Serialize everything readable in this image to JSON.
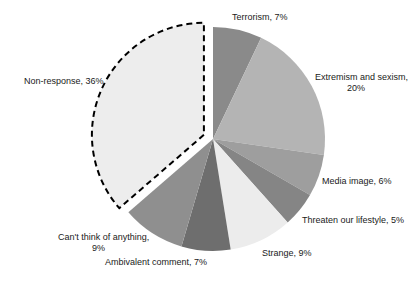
{
  "chart_data": {
    "type": "pie",
    "title": "",
    "start_angle_deg": 0,
    "direction": "clockwise",
    "slices": [
      {
        "label": "Terrorism",
        "value": 7,
        "display": "Terrorism, 7%",
        "color": "#8a8a8a",
        "exploded": false
      },
      {
        "label": "Extremism and sexism",
        "value": 20,
        "display_lines": [
          "Extremism and sexism,",
          "20%"
        ],
        "color": "#b4b4b4",
        "exploded": false
      },
      {
        "label": "Media image",
        "value": 6,
        "display": "Media image, 6%",
        "color": "#9e9e9e",
        "exploded": false
      },
      {
        "label": "Threaten our lifestyle",
        "value": 5,
        "display": "Threaten our lifestyle, 5%",
        "color": "#858585",
        "exploded": false
      },
      {
        "label": "Strange",
        "value": 9,
        "display": "Strange, 9%",
        "color": "#ececec",
        "exploded": false
      },
      {
        "label": "Ambivalent comment",
        "value": 7,
        "display": "Ambivalent comment, 7%",
        "color": "#6e6e6e",
        "exploded": false
      },
      {
        "label": "Can't think of anything",
        "value": 9,
        "display_lines": [
          "Can't think of anything,",
          "9%"
        ],
        "color": "#8f8f8f",
        "exploded": false
      },
      {
        "label": "Non-response",
        "value": 36,
        "display": "Non-response, 36%",
        "color": "#ededed",
        "exploded": true,
        "outline": "dashed"
      }
    ]
  }
}
